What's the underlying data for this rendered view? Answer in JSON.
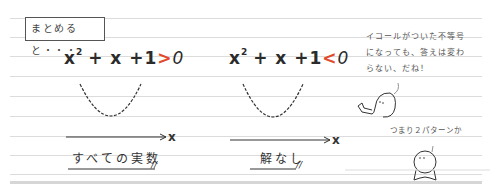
{
  "summary_label": "まとめると・・・",
  "left": {
    "equation": {
      "base": "x",
      "exp": "2",
      "rest": "+ x +1",
      "op": ">",
      "rhs": "0"
    },
    "axis_var": "x",
    "answer": "すべての実数",
    "end_mark": "//"
  },
  "right": {
    "equation": {
      "base": "x",
      "exp": "2",
      "rest": "+ x +1",
      "op": "<",
      "rhs": "0"
    },
    "axis_var": "x",
    "answer": "解なし",
    "end_mark": "//"
  },
  "notes": {
    "speech_lines": [
      "イコールがついた不等号",
      "になっても、答えは変わ",
      "らない、だね！"
    ],
    "second_comment": "つまり２パターンか"
  },
  "colors": {
    "inequality_accent": "#e24a2b",
    "ink": "#2b2b2b",
    "rule": "#dcdcdc"
  }
}
